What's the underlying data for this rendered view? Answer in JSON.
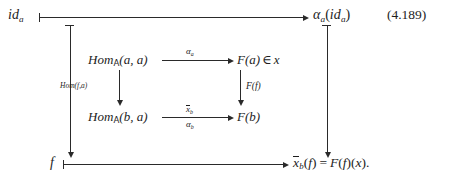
{
  "equation": {
    "number": "(4.189)"
  },
  "outer": {
    "top": {
      "source": {
        "base": "id",
        "sub": "a"
      },
      "target": {
        "fn": "α",
        "fn_sub": "a",
        "arg_base": "id",
        "arg_sub": "a"
      }
    },
    "bottom": {
      "source": "f",
      "target": {
        "x": "x",
        "x_sub": "b",
        "arg": "f",
        "eq": "=",
        "rhs_F": "F",
        "rhs_f": "f",
        "rhs_x": "x",
        "period": "."
      }
    }
  },
  "square": {
    "top_left": {
      "hom": "Hom",
      "cat": "A",
      "args": "(a, a)"
    },
    "top_right": {
      "F": "F",
      "arg": "(a)",
      "belongs": "∈",
      "elem": "x"
    },
    "bottom_left": {
      "hom": "Hom",
      "cat": "A",
      "args": "(b, a)"
    },
    "bottom_right": {
      "F": "F",
      "arg": "(b)"
    },
    "arrows": {
      "top": {
        "label": "α",
        "label_sub": "a"
      },
      "bottom_above": {
        "label": "x",
        "label_sub": "b",
        "overline": true
      },
      "bottom_below": {
        "label": "α",
        "label_sub": "b"
      },
      "left": {
        "label_fn": "Hom",
        "label_args": "(f,a)"
      },
      "right": {
        "label_fn": "F",
        "label_args": "(f)"
      }
    }
  }
}
